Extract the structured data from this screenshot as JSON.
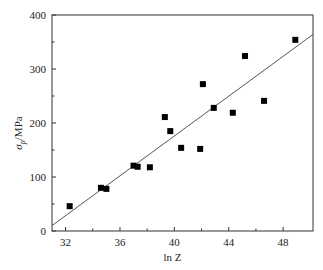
{
  "chart_data": {
    "type": "scatter",
    "title": "",
    "xlabel": "ln Z",
    "ylabel": "σp/MPa",
    "ylabel_main": "σ",
    "ylabel_sub": "p",
    "ylabel_rest": "/MPa",
    "xlim": [
      31,
      50.2
    ],
    "ylim": [
      0,
      400
    ],
    "xticks": [
      32,
      36,
      40,
      44,
      48
    ],
    "yticks": [
      0,
      100,
      200,
      300,
      400
    ],
    "grid": false,
    "legend": null,
    "series": [
      {
        "name": "measured",
        "marker": "square",
        "x": [
          32.3,
          34.6,
          35.0,
          37.0,
          37.3,
          38.2,
          39.3,
          39.7,
          40.5,
          41.9,
          42.1,
          42.9,
          44.3,
          45.2,
          46.6,
          48.9
        ],
        "y": [
          46,
          80,
          78,
          121,
          119,
          118,
          211,
          185,
          154,
          152,
          272,
          228,
          219,
          324,
          241,
          354
        ]
      },
      {
        "name": "linear fit",
        "type": "line",
        "x": [
          31,
          50.2
        ],
        "y": [
          10,
          364
        ]
      }
    ]
  }
}
